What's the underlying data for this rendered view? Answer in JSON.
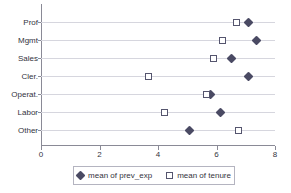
{
  "chart_data": {
    "type": "scatter",
    "title": "",
    "subtitle": "",
    "xlabel": "",
    "ylabel": "",
    "orientation": "horizontal",
    "categories": [
      "Prof",
      "Mgmt",
      "Sales",
      "Cler.",
      "Operat.",
      "Labor",
      "Other"
    ],
    "xlim": [
      0,
      8
    ],
    "xticks": [
      0,
      2,
      4,
      6,
      8
    ],
    "xtick_labels": [
      "0",
      "2",
      "4",
      "6",
      "8"
    ],
    "grid": true,
    "grid_axis": "y",
    "legend_position": "bottom",
    "series": [
      {
        "name": "mean of prev_exp",
        "marker": "diamond",
        "color": "#4a4a63",
        "values": [
          7.11,
          7.38,
          6.5,
          7.08,
          5.78,
          6.12,
          5.09
        ]
      },
      {
        "name": "mean of tenure",
        "marker": "square",
        "color": "#55556e",
        "values": [
          6.67,
          6.19,
          5.91,
          3.66,
          5.67,
          4.21,
          6.74
        ]
      }
    ]
  },
  "legend": {
    "entries": [
      {
        "label": "mean of prev_exp",
        "marker": "diamond"
      },
      {
        "label": "mean of tenure",
        "marker": "square"
      }
    ]
  },
  "colors": {
    "axis": "#8a8a96",
    "grid": "#d6d6de",
    "text": "#33333d",
    "marker_fill": "#4a4a63",
    "marker_outline": "#55556e",
    "background": "#ffffff"
  }
}
